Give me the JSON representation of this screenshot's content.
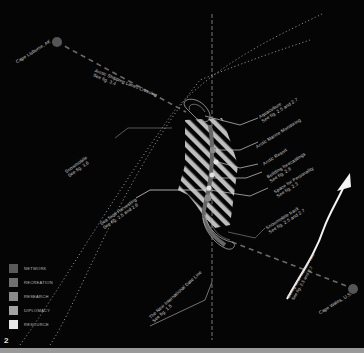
{
  "figure": {
    "number": "2",
    "background": "#050505"
  },
  "places": {
    "cape_lisburne": "Cape Lisburne, AK",
    "cape_wales": "Cape Wales, U.S."
  },
  "labels": {
    "shipping": {
      "title": "Arctic Shipping Lanes Crossing",
      "ref": "See fig. 3.4"
    },
    "snowmobile_left": {
      "title": "Snowmobile",
      "ref": "See fig. 3.6"
    },
    "seafood": {
      "title": "Sea food Harvesting",
      "ref": "See fig. 2.5 and 2.6"
    },
    "aquaculture": {
      "title": "Aquaculture",
      "ref": "See fig. 2.5 and 2.7"
    },
    "marine_monitoring": {
      "title": "Arctic Marine Monitoring",
      "ref": ""
    },
    "resort": {
      "title": "Arctic Resort",
      "ref": ""
    },
    "forecasting": {
      "title": "Building forecastings",
      "ref": "See fig. 2.8"
    },
    "personality": {
      "title": "Space for Personality",
      "ref": "See fig. 2.3"
    },
    "snowmobile_track": {
      "title": "Snowmobile track",
      "ref": "See fig. 2.5 and 2.7"
    },
    "date_line": {
      "title": "The New International Date Line",
      "ref": "See fig. 1.5"
    },
    "tourism_route": {
      "title": "Bering strait tourism route",
      "ref": "See fig. 2.5 and 2.7"
    }
  },
  "legend": [
    {
      "label": "NETWORK",
      "color": "#5a5a5a"
    },
    {
      "label": "RECREATION",
      "color": "#707070"
    },
    {
      "label": "RESEARCH",
      "color": "#8a8a8a"
    },
    {
      "label": "DIPLOMACY",
      "color": "#a3a3a3"
    },
    {
      "label": "RESOURCE",
      "color": "#e6e6e6"
    }
  ]
}
